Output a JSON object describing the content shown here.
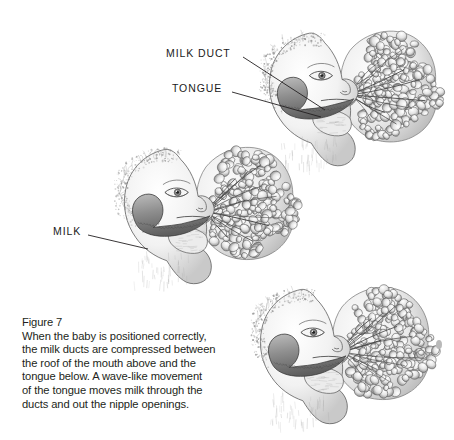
{
  "document": {
    "background_color": "#ffffff",
    "ink_color": "#231f20"
  },
  "caption": {
    "title": "Figure 7",
    "lines": [
      "When the baby is positioned correctly,",
      "the milk ducts are compressed between",
      "the roof of the mouth above and the",
      "tongue below. A wave-like movement",
      "of the tongue moves milk through the",
      "ducts and out the nipple openings."
    ],
    "full_text": "Figure 7 When the baby is positioned correctly, the milk ducts are compressed between the roof of the mouth above and the tongue below. A wave-like movement of the tongue moves milk through the ducts and out the nipple openings."
  },
  "callouts": [
    {
      "id": "milk-duct",
      "label": "MILK DUCT",
      "label_x": 166,
      "label_y": 47,
      "leader_from_x": 243,
      "leader_from_y": 57,
      "leader_to_x": 325,
      "leader_to_y": 110,
      "target_figure": "figure-top"
    },
    {
      "id": "tongue",
      "label": "TONGUE",
      "label_x": 172,
      "label_y": 82,
      "leader_from_x": 232,
      "leader_from_y": 92,
      "leader_to_x": 321,
      "leader_to_y": 117,
      "target_figure": "figure-top"
    },
    {
      "id": "milk",
      "label": "MILK",
      "label_x": 53,
      "label_y": 225,
      "leader_from_x": 88,
      "leader_from_y": 235,
      "leader_to_x": 148,
      "leader_to_y": 249,
      "target_figure": "figure-middle"
    }
  ],
  "figures": [
    {
      "id": "figure-top",
      "name": "infant-latched-breast-view-1",
      "description": "Infant head in profile latched onto breast, showing milk duct and tongue compression",
      "x": 248,
      "y": 12,
      "width": 196,
      "height": 160
    },
    {
      "id": "figure-middle",
      "name": "infant-latched-breast-view-2",
      "description": "Infant head in profile latched onto breast, tongue wave moving milk",
      "x": 104,
      "y": 128,
      "width": 196,
      "height": 162
    },
    {
      "id": "figure-bottom",
      "name": "infant-latched-breast-view-3",
      "description": "Infant head in profile latched onto breast, milk released from nipple openings",
      "x": 240,
      "y": 268,
      "width": 196,
      "height": 162
    }
  ],
  "specks": [
    {
      "x": 436,
      "y": 340,
      "w": 6,
      "h": 9
    },
    {
      "x": 261,
      "y": 355,
      "w": 3,
      "h": 3
    }
  ]
}
